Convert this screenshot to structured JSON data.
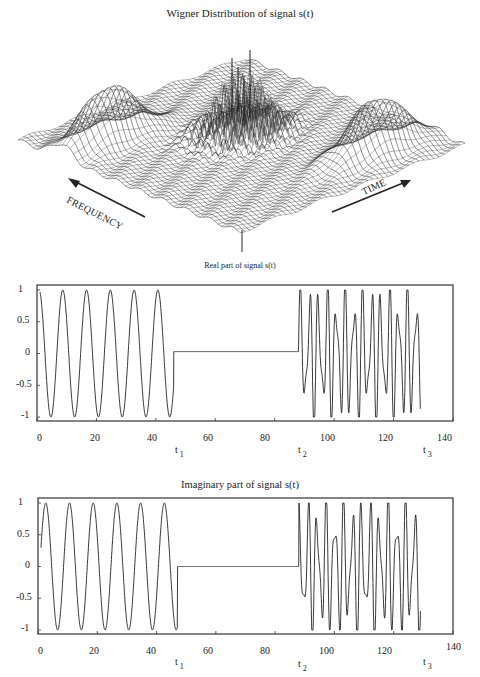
{
  "chart_data": [
    {
      "type": "surface3d",
      "title": "Wigner Distribution of signal s(t)",
      "axis_labels": {
        "frequency": "FREQUENCY",
        "time": "TIME"
      },
      "description": "3D wireframe of Wigner distribution: two smooth Gaussian-like ridges (left and right, corresponding to the two tone segments) and a central cluster of tall oscillating cross-term spikes",
      "features": [
        {
          "name": "left auto-term ridge",
          "position": "left"
        },
        {
          "name": "central interference terms",
          "position": "center",
          "note": "tall narrow spikes"
        },
        {
          "name": "right auto-term ridge",
          "position": "right"
        }
      ]
    },
    {
      "type": "line",
      "title": "Real part of signal s(t)",
      "xlabel": "",
      "ylabel": "",
      "xlim": [
        0,
        140
      ],
      "ylim": [
        -1,
        1
      ],
      "xticks": [
        0,
        20,
        40,
        60,
        80,
        100,
        120,
        140
      ],
      "yticks": [
        1,
        0.5,
        0,
        -0.5,
        -1
      ],
      "ytick_labels": [
        "1",
        "0.5",
        "0",
        "-0.5",
        "-1"
      ],
      "markers": [
        {
          "label": "t",
          "sub": "1",
          "x": 47
        },
        {
          "label": "t",
          "sub": "2",
          "x": 89
        },
        {
          "label": "t",
          "sub": "3",
          "x": 130
        }
      ],
      "segments": [
        {
          "x_start": 1,
          "x_end": 46,
          "kind": "sinusoid",
          "period": 8,
          "amplitude": 1,
          "phase": "cos"
        },
        {
          "x_start": 46,
          "x_end": 88,
          "kind": "flat",
          "value": 0.03
        },
        {
          "x_start": 88,
          "x_end": 129,
          "kind": "chirp-like",
          "approx_period": 3.0,
          "amplitude_range": [
            -1,
            1
          ]
        }
      ],
      "grid": false
    },
    {
      "type": "line",
      "title": "Imaginary part of signal s(t)",
      "xlabel": "",
      "ylabel": "",
      "xlim": [
        0,
        140
      ],
      "ylim": [
        -1,
        1
      ],
      "xticks": [
        0,
        20,
        40,
        60,
        80,
        100,
        120,
        140
      ],
      "yticks": [
        1,
        0.5,
        0,
        -0.5,
        -1
      ],
      "ytick_labels": [
        "1",
        "0.5",
        "0",
        "-0.5",
        "-1"
      ],
      "markers": [
        {
          "label": "t",
          "sub": "1",
          "x": 47
        },
        {
          "label": "t",
          "sub": "2",
          "x": 89
        },
        {
          "label": "t",
          "sub": "3",
          "x": 130
        }
      ],
      "segments": [
        {
          "x_start": 1,
          "x_end": 47,
          "kind": "sinusoid",
          "period": 8,
          "amplitude": 1,
          "phase": "sin"
        },
        {
          "x_start": 47,
          "x_end": 88,
          "kind": "flat",
          "value": 0
        },
        {
          "x_start": 88,
          "x_end": 129,
          "kind": "chirp-like",
          "approx_period": 3.0,
          "amplitude_range": [
            -1,
            1
          ]
        }
      ],
      "grid": false
    }
  ],
  "labels": {
    "wigner_title": "Wigner Distribution of signal s(t)",
    "frequency": "FREQUENCY",
    "time": "TIME",
    "real_title": "Real part of signal s(t)",
    "imag_title": "Imaginary part of signal s(t)",
    "x_ticks": [
      "0",
      "20",
      "40",
      "60",
      "80",
      "100",
      "120",
      "140"
    ],
    "y_ticks": [
      "1",
      "0.5",
      "0",
      "-0.5",
      "-1"
    ],
    "t_label": "t",
    "t1_sub": "1",
    "t2_sub": "2",
    "t3_sub": "3"
  }
}
